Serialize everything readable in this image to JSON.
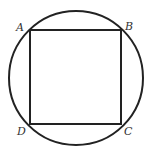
{
  "diagram": {
    "circle": {
      "cx": 76,
      "cy": 78,
      "r": 67
    },
    "square": {
      "x": 30,
      "y": 30,
      "width": 91,
      "height": 94
    },
    "labels": {
      "A": "A",
      "B": "B",
      "C": "C",
      "D": "D"
    },
    "stroke_color": "#222222"
  }
}
